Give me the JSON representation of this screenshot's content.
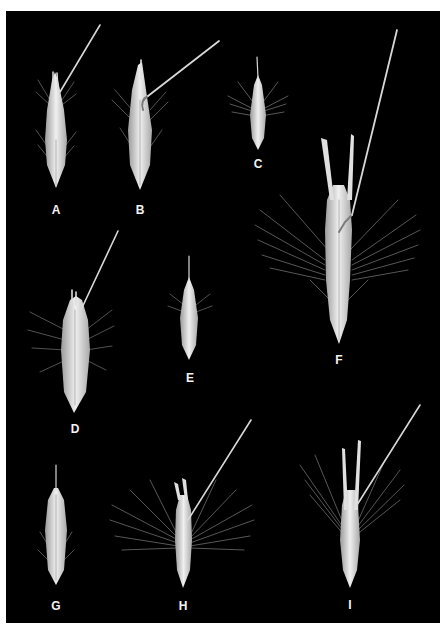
{
  "figure": {
    "background": "#000000",
    "border": "#ffffff",
    "specimen_color": "#e8e8e8",
    "panels": [
      {
        "label": "A",
        "x": 56,
        "y": 210
      },
      {
        "label": "B",
        "x": 140,
        "y": 210
      },
      {
        "label": "C",
        "x": 258,
        "y": 164
      },
      {
        "label": "D",
        "x": 75,
        "y": 429
      },
      {
        "label": "E",
        "x": 190,
        "y": 378
      },
      {
        "label": "F",
        "x": 339,
        "y": 360
      },
      {
        "label": "G",
        "x": 56,
        "y": 606
      },
      {
        "label": "H",
        "x": 183,
        "y": 606
      },
      {
        "label": "I",
        "x": 350,
        "y": 605
      }
    ]
  }
}
